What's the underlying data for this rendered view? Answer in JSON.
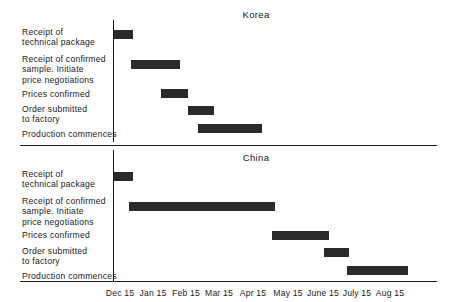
{
  "chart_data": {
    "type": "bar",
    "title": "",
    "subtitle": "",
    "xlabel": "",
    "ylabel": "",
    "orientation": "horizontal-gantt",
    "grid": false,
    "legend": "none",
    "axis": {
      "tick_labels": [
        "Dec 15",
        "Jan 15",
        "Feb 15",
        "Mar 15",
        "Apr 15",
        "May 15",
        "June 15",
        "July 15",
        "Aug 15"
      ],
      "tick_months": [
        0,
        1,
        2,
        3,
        4,
        5,
        6,
        7,
        8
      ],
      "xlim": [
        0,
        8.2
      ]
    },
    "tasks": [
      "Receipt of\ntechnical package",
      "Receipt of confirmed\nsample.  Initiate\nprice negotiations",
      "Prices confirmed",
      "Order submitted\nto factory",
      "Production commences"
    ],
    "panels": [
      {
        "name": "Korea",
        "bars": [
          {
            "task": "Receipt of technical package",
            "start_month": 0.0,
            "end_month": 0.58
          },
          {
            "task": "Receipt of confirmed sample.  Initiate price negotiations",
            "start_month": 0.52,
            "end_month": 1.97
          },
          {
            "task": "Prices confirmed",
            "start_month": 1.42,
            "end_month": 2.21
          },
          {
            "task": "Order submitted to factory",
            "start_month": 2.21,
            "end_month": 3.0
          },
          {
            "task": "Production commences",
            "start_month": 2.52,
            "end_month": 4.42
          }
        ]
      },
      {
        "name": "China",
        "bars": [
          {
            "task": "Receipt of technical package",
            "start_month": 0.0,
            "end_month": 0.58
          },
          {
            "task": "Receipt of confirmed sample.  Initiate price negotiations",
            "start_month": 0.45,
            "end_month": 4.82
          },
          {
            "task": "Prices confirmed",
            "start_month": 4.73,
            "end_month": 6.42
          },
          {
            "task": "Order submitted to factory",
            "start_month": 6.27,
            "end_month": 7.0
          },
          {
            "task": "Production commences",
            "start_month": 6.94,
            "end_month": 8.76
          }
        ]
      }
    ]
  },
  "panels": {
    "korea": {
      "title": "Korea"
    },
    "china": {
      "title": "China"
    }
  },
  "rows": {
    "r1": "Receipt of\ntechnical package",
    "r2": "Receipt of confirmed\nsample.  Initiate\nprice negotiations",
    "r3": "Prices confirmed",
    "r4": "Order submitted\nto factory",
    "r5": "Production commences"
  },
  "ticks": {
    "t0": "Dec 15",
    "t1": "Jan 15",
    "t2": "Feb 15",
    "t3": "Mar 15",
    "t4": "Apr 15",
    "t5": "May 15",
    "t6": "June 15",
    "t7": "July 15",
    "t8": "Aug 15"
  },
  "colors": {
    "bar": "#2a2a2a",
    "axis": "#1a1a1a",
    "text": "#1a1a1a",
    "background": "#ffffff"
  }
}
